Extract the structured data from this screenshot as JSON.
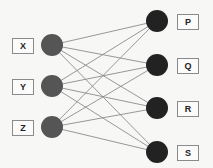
{
  "diagram": {
    "type": "bipartite-graph",
    "left_nodes": [
      {
        "id": "X",
        "label": "X",
        "cx": 52,
        "cy": 45,
        "box_x": 12,
        "box_y": 38
      },
      {
        "id": "Y",
        "label": "Y",
        "cx": 52,
        "cy": 86,
        "box_x": 12,
        "box_y": 79
      },
      {
        "id": "Z",
        "label": "Z",
        "cx": 52,
        "cy": 127,
        "box_x": 12,
        "box_y": 120
      }
    ],
    "right_nodes": [
      {
        "id": "P",
        "label": "P",
        "cx": 157,
        "cy": 21,
        "box_x": 177,
        "box_y": 14
      },
      {
        "id": "Q",
        "label": "Q",
        "cx": 157,
        "cy": 65,
        "box_x": 177,
        "box_y": 58
      },
      {
        "id": "R",
        "label": "R",
        "cx": 157,
        "cy": 108,
        "box_x": 177,
        "box_y": 101
      },
      {
        "id": "S",
        "label": "S",
        "cx": 157,
        "cy": 152,
        "box_x": 177,
        "box_y": 145
      }
    ],
    "edges": [
      [
        "X",
        "P"
      ],
      [
        "X",
        "Q"
      ],
      [
        "X",
        "R"
      ],
      [
        "X",
        "S"
      ],
      [
        "Y",
        "P"
      ],
      [
        "Y",
        "Q"
      ],
      [
        "Y",
        "R"
      ],
      [
        "Y",
        "S"
      ],
      [
        "Z",
        "P"
      ],
      [
        "Z",
        "Q"
      ],
      [
        "Z",
        "R"
      ],
      [
        "Z",
        "S"
      ]
    ],
    "colors": {
      "left_node_fill": "#555555",
      "right_node_fill": "#222222",
      "edge": "#8c8c8c",
      "box_border": "#8a8a8a"
    },
    "node_radius": 11
  }
}
